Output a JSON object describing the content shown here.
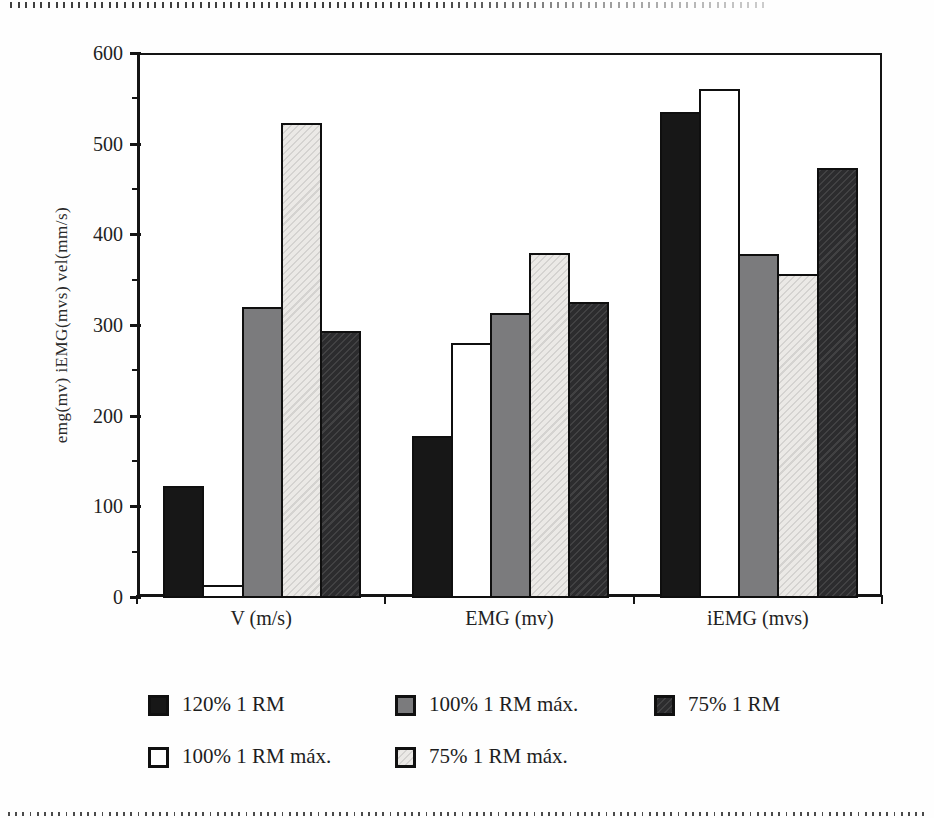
{
  "page": {
    "background": "#fefefe"
  },
  "decorations": {
    "top_dotted_divider": true,
    "bottom_dotted_divider": true
  },
  "chart_data": {
    "type": "bar",
    "title": "",
    "categories": [
      "V (m/s)",
      "EMG (mv)",
      "iEMG (mvs)"
    ],
    "series": [
      {
        "name": "120% 1 RM",
        "style": "black",
        "values": [
          122,
          178,
          535
        ]
      },
      {
        "name": "100% 1 RM máx.",
        "style": "white",
        "values": [
          13,
          280,
          560
        ]
      },
      {
        "name": "100% 1 RM máx.",
        "style": "gray",
        "values": [
          320,
          313,
          378
        ]
      },
      {
        "name": "75% 1 RM máx.",
        "style": "light",
        "values": [
          523,
          379,
          356
        ]
      },
      {
        "name": "75% 1 RM",
        "style": "dark",
        "values": [
          293,
          325,
          473
        ]
      }
    ],
    "xlabel": "",
    "ylabel": "emg(mv)  iEMG(mvs)  vel(mm/s)",
    "ylim": [
      0,
      600
    ],
    "ytick_step": 100,
    "yminor_step": 50,
    "yticks": [
      0,
      100,
      200,
      300,
      400,
      500,
      600
    ],
    "grid": false,
    "legend_position": "bottom",
    "legend_rows": [
      [
        {
          "label": "120% 1 RM",
          "style": "black"
        },
        {
          "label": "100% 1 RM máx.",
          "style": "gray"
        },
        {
          "label": "75% 1 RM",
          "style": "dark"
        }
      ],
      [
        {
          "label": "100% 1 RM máx.",
          "style": "white"
        },
        {
          "label": "75% 1 RM máx.",
          "style": "light"
        }
      ]
    ],
    "colors": {
      "black": "#171717",
      "white": "#ffffff",
      "gray": "#7b7b7d",
      "light": "#ebe9e6",
      "dark": "#2c2c2e",
      "axis": "#141414"
    }
  }
}
